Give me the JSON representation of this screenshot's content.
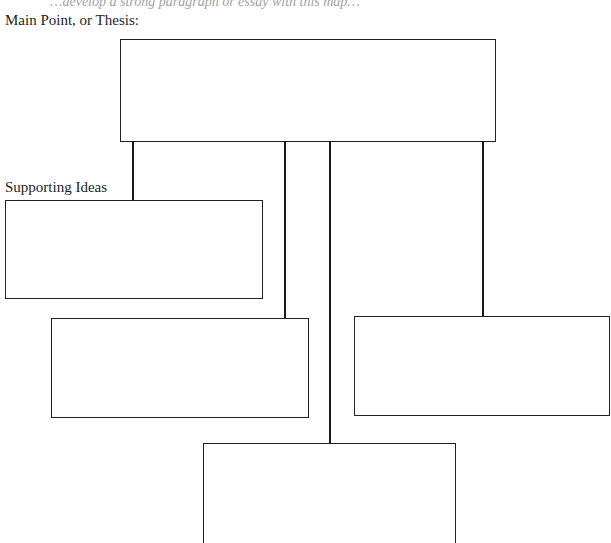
{
  "page": {
    "cut_line": "…develop a strong paragraph or essay with this map…",
    "thesis_label": "Main Point, or Thesis:",
    "supporting_label": "Supporting Ideas"
  },
  "diagram": {
    "type": "organizer-tree",
    "root": {
      "name": "main-point-box",
      "text": ""
    },
    "children": [
      {
        "name": "supporting-idea-box-1",
        "text": ""
      },
      {
        "name": "supporting-idea-box-2",
        "text": ""
      },
      {
        "name": "supporting-idea-box-3",
        "text": ""
      },
      {
        "name": "supporting-idea-box-4",
        "text": ""
      }
    ]
  }
}
